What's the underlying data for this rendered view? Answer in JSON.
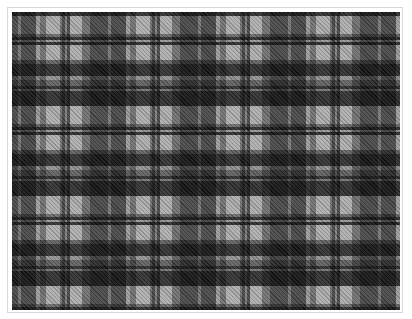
{
  "image": {
    "subject": "black-white-grey tartan plaid pattern",
    "colors": {
      "dark": "#2e2e2e",
      "mid": "#7a7a7a",
      "light": "#f2f2f2",
      "border": "#d8d8d8",
      "background": "#ffffff"
    },
    "sett_repeat_px": {
      "horizontal": 90,
      "vertical": 90
    }
  }
}
